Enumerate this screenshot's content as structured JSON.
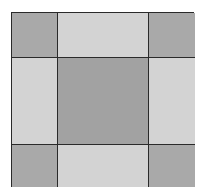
{
  "diagram": {
    "type": "3x3 square grid (quilt block / square-frame pattern)",
    "rows": 3,
    "cols": 3,
    "colors": {
      "corner": "#a9a9a9",
      "edge": "#d3d3d3",
      "center": "#a2a2a2",
      "line": "#2a2a2a"
    },
    "cells": [
      [
        "corner",
        "edge",
        "corner"
      ],
      [
        "edge",
        "center",
        "edge"
      ],
      [
        "corner",
        "edge",
        "corner"
      ]
    ]
  }
}
